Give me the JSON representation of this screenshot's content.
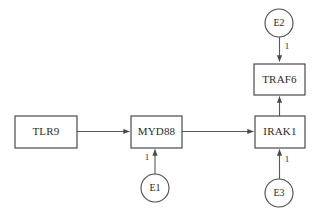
{
  "diagram": {
    "type": "directed-graph",
    "background_color": "#ffffff",
    "stroke_color": "#4a4a4a",
    "text_color": "#2b2b2b",
    "nodes": [
      {
        "id": "TLR9",
        "label": "TLR9",
        "shape": "rect",
        "x": 15,
        "y": 116,
        "w": 62,
        "h": 32
      },
      {
        "id": "MYD88",
        "label": "MYD88",
        "shape": "rect",
        "x": 131,
        "y": 116,
        "w": 51,
        "h": 32
      },
      {
        "id": "IRAK1",
        "label": "IRAK1",
        "shape": "rect",
        "x": 255,
        "y": 116,
        "w": 50,
        "h": 32
      },
      {
        "id": "TRAF6",
        "label": "TRAF6",
        "shape": "rect",
        "x": 254,
        "y": 64,
        "w": 51,
        "h": 31
      },
      {
        "id": "E1",
        "label": "E1",
        "shape": "circle",
        "cx": 155,
        "cy": 188,
        "r": 14
      },
      {
        "id": "E2",
        "label": "E2",
        "shape": "circle",
        "cx": 279,
        "cy": 23,
        "r": 14
      },
      {
        "id": "E3",
        "label": "E3",
        "shape": "circle",
        "cx": 279,
        "cy": 193,
        "r": 14
      }
    ],
    "edges": [
      {
        "from": "TLR9",
        "to": "MYD88",
        "weight": "",
        "orientation": "horizontal"
      },
      {
        "from": "MYD88",
        "to": "IRAK1",
        "weight": "",
        "orientation": "horizontal"
      },
      {
        "from": "IRAK1",
        "to": "TRAF6",
        "weight": "",
        "orientation": "vertical-up"
      },
      {
        "from": "E1",
        "to": "MYD88",
        "weight": "1",
        "orientation": "vertical-up",
        "label_x": 147,
        "label_y": 158
      },
      {
        "from": "E3",
        "to": "IRAK1",
        "weight": "1",
        "orientation": "vertical-up",
        "label_x": 287,
        "label_y": 160
      },
      {
        "from": "E2",
        "to": "TRAF6",
        "weight": "1",
        "orientation": "vertical-down",
        "label_x": 287,
        "label_y": 47
      }
    ]
  }
}
